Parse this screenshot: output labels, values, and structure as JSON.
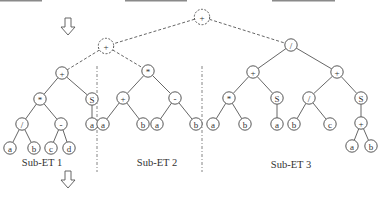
{
  "diagram": {
    "type": "expression-tree-decomposition",
    "root": {
      "id": "root",
      "symbol": "+",
      "style": "dashed"
    },
    "connector": {
      "id": "mid",
      "symbol": "+",
      "style": "dashed"
    },
    "subtrees": [
      {
        "label": "Sub-ET 1",
        "expression": "((a / b) * (c - d)) + S(a)"
      },
      {
        "label": "Sub-ET 2",
        "expression": "(a + b) * (a - b)"
      },
      {
        "label": "Sub-ET 3",
        "expression": "((a * b) + S(a)) / ((b / c) + S(a + b))"
      }
    ]
  },
  "nodes": [
    {
      "id": "root",
      "symbol": "+",
      "x": 202,
      "y": 17,
      "dashed": true
    },
    {
      "id": "mid",
      "symbol": "+",
      "x": 106,
      "y": 46,
      "dashed": true
    },
    {
      "id": "e1",
      "symbol": "+",
      "x": 62,
      "y": 73
    },
    {
      "id": "e1m",
      "symbol": "*",
      "x": 40,
      "y": 99
    },
    {
      "id": "e1s",
      "symbol": "S",
      "x": 92,
      "y": 99
    },
    {
      "id": "e1d",
      "symbol": "/",
      "x": 22,
      "y": 124
    },
    {
      "id": "e1n",
      "symbol": "-",
      "x": 61,
      "y": 124
    },
    {
      "id": "e1sa",
      "symbol": "a",
      "x": 92,
      "y": 124
    },
    {
      "id": "e1a",
      "symbol": "a",
      "x": 10,
      "y": 148
    },
    {
      "id": "e1b",
      "symbol": "b",
      "x": 34,
      "y": 148
    },
    {
      "id": "e1c",
      "symbol": "c",
      "x": 51,
      "y": 148
    },
    {
      "id": "e1dd",
      "symbol": "d",
      "x": 69,
      "y": 148
    },
    {
      "id": "e2",
      "symbol": "*",
      "x": 148,
      "y": 71
    },
    {
      "id": "e2p",
      "symbol": "+",
      "x": 123,
      "y": 98
    },
    {
      "id": "e2n",
      "symbol": "-",
      "x": 175,
      "y": 98
    },
    {
      "id": "e2a1",
      "symbol": "a",
      "x": 103,
      "y": 124
    },
    {
      "id": "e2b1",
      "symbol": "b",
      "x": 143,
      "y": 124
    },
    {
      "id": "e2a2",
      "symbol": "a",
      "x": 157,
      "y": 124
    },
    {
      "id": "e2b2",
      "symbol": "b",
      "x": 196,
      "y": 124
    },
    {
      "id": "e3",
      "symbol": "/",
      "x": 291,
      "y": 45
    },
    {
      "id": "e3l",
      "symbol": "+",
      "x": 253,
      "y": 72
    },
    {
      "id": "e3r",
      "symbol": "+",
      "x": 337,
      "y": 72
    },
    {
      "id": "e3lm",
      "symbol": "*",
      "x": 229,
      "y": 98
    },
    {
      "id": "e3ls",
      "symbol": "S",
      "x": 277,
      "y": 98
    },
    {
      "id": "e3rd",
      "symbol": "/",
      "x": 309,
      "y": 98
    },
    {
      "id": "e3rs",
      "symbol": "S",
      "x": 361,
      "y": 98
    },
    {
      "id": "e3a1",
      "symbol": "a",
      "x": 213,
      "y": 124
    },
    {
      "id": "e3b1",
      "symbol": "b",
      "x": 245,
      "y": 124
    },
    {
      "id": "e3a2",
      "symbol": "a",
      "x": 277,
      "y": 124
    },
    {
      "id": "e3b2",
      "symbol": "b",
      "x": 294,
      "y": 124
    },
    {
      "id": "e3c",
      "symbol": "c",
      "x": 330,
      "y": 124
    },
    {
      "id": "e3p",
      "symbol": "+",
      "x": 361,
      "y": 123
    },
    {
      "id": "e3a3",
      "symbol": "a",
      "x": 352,
      "y": 146
    },
    {
      "id": "e3b3",
      "symbol": "b",
      "x": 371,
      "y": 146
    }
  ],
  "edges": [
    [
      "root",
      "mid",
      "dashed"
    ],
    [
      "root",
      "e3",
      "dashed"
    ],
    [
      "mid",
      "e1",
      "dashed"
    ],
    [
      "mid",
      "e2",
      "dashed"
    ],
    [
      "e1",
      "e1m"
    ],
    [
      "e1",
      "e1s"
    ],
    [
      "e1m",
      "e1d"
    ],
    [
      "e1m",
      "e1n"
    ],
    [
      "e1s",
      "e1sa"
    ],
    [
      "e1d",
      "e1a"
    ],
    [
      "e1d",
      "e1b"
    ],
    [
      "e1n",
      "e1c"
    ],
    [
      "e1n",
      "e1dd"
    ],
    [
      "e2",
      "e2p"
    ],
    [
      "e2",
      "e2n"
    ],
    [
      "e2p",
      "e2a1"
    ],
    [
      "e2p",
      "e2b1"
    ],
    [
      "e2n",
      "e2a2"
    ],
    [
      "e2n",
      "e2b2"
    ],
    [
      "e3",
      "e3l"
    ],
    [
      "e3",
      "e3r"
    ],
    [
      "e3l",
      "e3lm"
    ],
    [
      "e3l",
      "e3ls"
    ],
    [
      "e3r",
      "e3rd"
    ],
    [
      "e3r",
      "e3rs"
    ],
    [
      "e3lm",
      "e3a1"
    ],
    [
      "e3lm",
      "e3b1"
    ],
    [
      "e3ls",
      "e3a2"
    ],
    [
      "e3rd",
      "e3b2"
    ],
    [
      "e3rd",
      "e3c"
    ],
    [
      "e3rs",
      "e3p"
    ],
    [
      "e3p",
      "e3a3"
    ],
    [
      "e3p",
      "e3b3"
    ]
  ],
  "labels": {
    "sub1": "Sub-ET 1",
    "sub2": "Sub-ET 2",
    "sub3": "Sub-ET 3"
  },
  "colors": {
    "stroke": "#444444",
    "text": "#333333",
    "bar": "#8a8a8a",
    "background": "#ffffff"
  }
}
